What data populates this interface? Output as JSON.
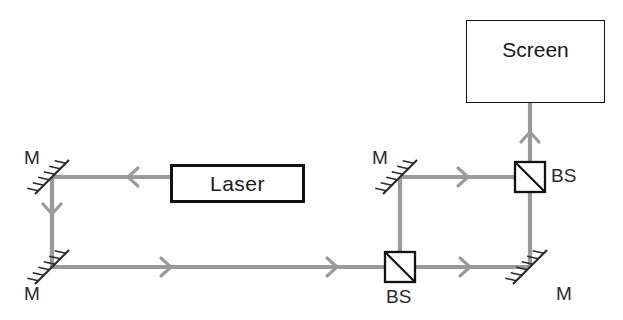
{
  "diagram": {
    "colors": {
      "beam": "#9a9a9a",
      "ink": "#1a1a1a",
      "background": "#ffffff"
    },
    "components": {
      "laser": {
        "label": "Laser",
        "x": 170,
        "y": 164,
        "w": 135,
        "h": 39
      },
      "screen": {
        "label": "Screen",
        "x": 466,
        "y": 20,
        "w": 139,
        "h": 83
      },
      "mirrors": [
        {
          "name": "mirror-top-left",
          "label": "M",
          "x": 52,
          "y": 177,
          "label_x": 24,
          "label_y": 147
        },
        {
          "name": "mirror-bottom-left",
          "label": "M",
          "x": 52,
          "y": 267,
          "label_x": 24,
          "label_y": 283
        },
        {
          "name": "mirror-middle",
          "label": "M",
          "x": 400,
          "y": 177,
          "label_x": 372,
          "label_y": 147
        },
        {
          "name": "mirror-bottom-right",
          "label": "M",
          "x": 530,
          "y": 267,
          "label_x": 556,
          "label_y": 283
        }
      ],
      "beamsplitters": [
        {
          "name": "beamsplitter-lower",
          "label": "BS",
          "x": 400,
          "y": 267,
          "label_x": 386,
          "label_y": 286
        },
        {
          "name": "beamsplitter-upper",
          "label": "BS",
          "x": 530,
          "y": 177,
          "label_x": 551,
          "label_y": 165
        }
      ]
    },
    "beam_segments": [
      {
        "name": "beam-laser-to-top-left-mirror",
        "from": [
          170,
          177
        ],
        "to": [
          52,
          177
        ]
      },
      {
        "name": "beam-left-vertical",
        "from": [
          52,
          177
        ],
        "to": [
          52,
          267
        ]
      },
      {
        "name": "beam-bottom-horizontal",
        "from": [
          52,
          267
        ],
        "to": [
          400,
          267
        ]
      },
      {
        "name": "beam-lower-bs-to-right-mirror",
        "from": [
          400,
          267
        ],
        "to": [
          530,
          267
        ]
      },
      {
        "name": "beam-lower-bs-to-middle-mirror",
        "from": [
          400,
          267
        ],
        "to": [
          400,
          177
        ]
      },
      {
        "name": "beam-middle-mirror-to-upper-bs",
        "from": [
          400,
          177
        ],
        "to": [
          530,
          177
        ]
      },
      {
        "name": "beam-right-vertical",
        "from": [
          530,
          267
        ],
        "to": [
          530,
          177
        ]
      },
      {
        "name": "beam-upper-bs-to-screen",
        "from": [
          530,
          177
        ],
        "to": [
          530,
          62
        ]
      }
    ],
    "arrows": [
      {
        "name": "arrow-laser-left",
        "x": 128,
        "y": 177,
        "dir": "left"
      },
      {
        "name": "arrow-left-down",
        "x": 52,
        "y": 214,
        "dir": "down"
      },
      {
        "name": "arrow-bottom-right-1",
        "x": 171,
        "y": 267,
        "dir": "right"
      },
      {
        "name": "arrow-bottom-right-2",
        "x": 337,
        "y": 267,
        "dir": "right"
      },
      {
        "name": "arrow-lower-right-1",
        "x": 470,
        "y": 267,
        "dir": "right"
      },
      {
        "name": "arrow-middle-right-1",
        "x": 468,
        "y": 177,
        "dir": "right"
      },
      {
        "name": "arrow-screen-up",
        "x": 530,
        "y": 132,
        "dir": "up"
      }
    ]
  }
}
